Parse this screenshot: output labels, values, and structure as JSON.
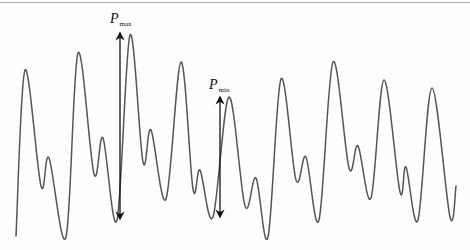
{
  "figure": {
    "curve_color": "#555555",
    "arrow_color": "#111111",
    "labels": {
      "pmax": {
        "main": "P",
        "sub": "max"
      },
      "pmin": {
        "main": "P",
        "sub": "min"
      }
    },
    "curve_points": [
      [
        16,
        236
      ],
      [
        25,
        70
      ],
      [
        41,
        186
      ],
      [
        49,
        158
      ],
      [
        66,
        237
      ],
      [
        78,
        53
      ],
      [
        94,
        174
      ],
      [
        103,
        138
      ],
      [
        117,
        220
      ],
      [
        130,
        35
      ],
      [
        143,
        162
      ],
      [
        151,
        130
      ],
      [
        166,
        199
      ],
      [
        181,
        62
      ],
      [
        193,
        189
      ],
      [
        200,
        170
      ],
      [
        213,
        217
      ],
      [
        229,
        97
      ],
      [
        245,
        206
      ],
      [
        256,
        178
      ],
      [
        268,
        237
      ],
      [
        281,
        79
      ],
      [
        296,
        180
      ],
      [
        306,
        157
      ],
      [
        319,
        220
      ],
      [
        333,
        62
      ],
      [
        349,
        168
      ],
      [
        358,
        146
      ],
      [
        371,
        198
      ],
      [
        384,
        80
      ],
      [
        400,
        192
      ],
      [
        406,
        167
      ],
      [
        418,
        220
      ],
      [
        432,
        88
      ],
      [
        450,
        217
      ],
      [
        456,
        186
      ]
    ],
    "arrows": {
      "pmax": {
        "x": 120,
        "y_top": 32,
        "y_bottom": 220
      },
      "pmin": {
        "x": 220,
        "y_top": 96,
        "y_bottom": 218
      }
    }
  }
}
